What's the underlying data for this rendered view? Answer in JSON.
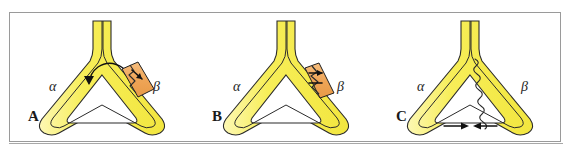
{
  "figure": {
    "background_color": "#ffffff",
    "frame_color": "#9a9a9a",
    "panel_count": 3
  },
  "style": {
    "tube_fill": "#F7EE58",
    "tube_fill_light": "#FCF7A6",
    "tube_stroke": "#2b2b2b",
    "block_fill": "#F0A85A",
    "block_stroke": "#1f1f1f",
    "arrow_color": "#111111",
    "label_color": "#262626"
  },
  "panels": [
    {
      "id": "A",
      "letter": "A",
      "left_label": "α",
      "right_label": "β",
      "shape": "triangular-loop-with-neck",
      "features": [
        "orange-block-on-right-arm",
        "zigzag-line-in-block",
        "short-arrow-in-block",
        "curved-arrow-counterclockwise-inside-loop"
      ]
    },
    {
      "id": "B",
      "letter": "B",
      "left_label": "α",
      "right_label": "β",
      "shape": "triangular-loop-with-neck",
      "features": [
        "orange-block-on-right-arm-narrow",
        "zigzag-line-in-block",
        "short-arrow-in-block"
      ]
    },
    {
      "id": "C",
      "letter": "C",
      "left_label": "α",
      "right_label": "β",
      "shape": "triangular-loop-with-neck",
      "features": [
        "wavy-scalloped-inner-edge-right-arm",
        "two-converging-arrows-at-bottom"
      ]
    }
  ]
}
